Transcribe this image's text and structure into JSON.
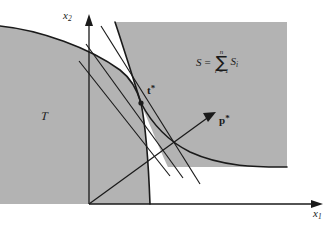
{
  "figure": {
    "background_color": "#ffffff",
    "region_fill_color": "#b3b3b3",
    "stroke_color": "#1a1a1a"
  },
  "axes": {
    "x_label": "x",
    "x_subscript": "1",
    "y_label": "x",
    "y_subscript": "2",
    "origin": {
      "x": 89,
      "y": 204
    }
  },
  "regions": [
    {
      "id": "region-T",
      "label": "T",
      "label_kind": "script-T",
      "label_pos": {
        "x": 44,
        "y": 115
      },
      "description": "technology set, left gray region bounded above-right by a concave decreasing curve"
    },
    {
      "id": "region-S",
      "label": "S",
      "label_kind": "set-S",
      "description": "aggregate preferred set, upper-right gray region bounded below-left by a convex curve"
    }
  ],
  "formula": {
    "lhs": "S",
    "equals": "=",
    "sum_sign": "∑",
    "sum_upper": "n",
    "sum_lower": "i = 1",
    "term": "S",
    "term_subscript": "i",
    "position": {
      "x": 196,
      "y": 49
    }
  },
  "points": [
    {
      "id": "point-t-star",
      "label": "t",
      "superscript": "*",
      "bold": true,
      "marker": "filled-dot",
      "coords": {
        "x": 141,
        "y": 103
      },
      "label_pos": {
        "x": 147,
        "y": 88
      }
    }
  ],
  "vectors": [
    {
      "id": "vector-p-star",
      "label": "p",
      "superscript": "*",
      "bold": true,
      "arrow": true,
      "from": {
        "x": 89,
        "y": 204
      },
      "to": {
        "x": 216,
        "y": 112
      },
      "label_pos": {
        "x": 219,
        "y": 119
      }
    }
  ],
  "tangent_lines": [
    {
      "id": "tangent-line-1",
      "from": {
        "x": 101,
        "y": 26
      },
      "to": {
        "x": 200,
        "y": 184
      }
    },
    {
      "id": "tangent-line-2",
      "from": {
        "x": 86,
        "y": 44
      },
      "to": {
        "x": 183,
        "y": 178
      }
    },
    {
      "id": "tangent-line-3",
      "from": {
        "x": 79,
        "y": 61
      },
      "to": {
        "x": 170,
        "y": 176
      }
    }
  ],
  "curves": [
    {
      "id": "curve-T-boundary",
      "description": "concave boundary of T from left edge through t* down to x-axis"
    },
    {
      "id": "curve-S-boundary",
      "description": "convex boundary of S from top through t* out to the right"
    }
  ]
}
